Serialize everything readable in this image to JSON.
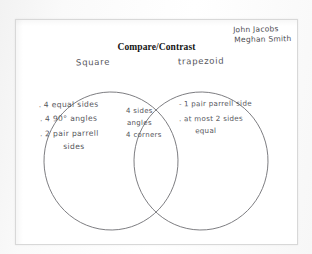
{
  "document": {
    "type": "worksheet-scan",
    "title": "Compare/Contrast",
    "student_names": [
      "John Jacobs",
      "Meghan Smith"
    ]
  },
  "venn": {
    "left_label": "Square",
    "right_label": "trapezoid",
    "left_only": [
      {
        "bullet": ".",
        "text": "4 equal sides"
      },
      {
        "bullet": ".",
        "text": "4 90° angles"
      },
      {
        "bullet": ".",
        "text": "2 pair parrell",
        "sub": "sides"
      }
    ],
    "overlap": [
      {
        "text": "4 sides"
      },
      {
        "text": "angles"
      },
      {
        "text": "4 corners"
      }
    ],
    "right_only": [
      {
        "bullet": "-",
        "text": "1 pair parrell side"
      },
      {
        "bullet": ".",
        "text": "at most 2 sides",
        "sub": "equal"
      }
    ]
  },
  "colors": {
    "ink": "#55555b",
    "title_ink": "#141414",
    "paper": "#ffffff",
    "circle_stroke": "#6f6f74",
    "page_border": "#d8d8d8"
  }
}
